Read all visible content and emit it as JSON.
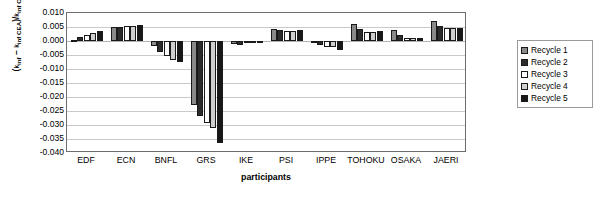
{
  "chart_data": {
    "type": "bar",
    "title": "",
    "xlabel": "participants",
    "ylabel": "(kinf - kinf CEA)/kinf CEA",
    "ylim": [
      -0.04,
      0.01
    ],
    "ytick_labels": [
      "0.010",
      "0.005",
      "0.000",
      "-0.005",
      "-0.010",
      "-0.015",
      "-0.020",
      "-0.025",
      "-0.030",
      "-0.035",
      "-0.040"
    ],
    "ytick_values": [
      0.01,
      0.005,
      0.0,
      -0.005,
      -0.01,
      -0.015,
      -0.02,
      -0.025,
      -0.03,
      -0.035,
      -0.04
    ],
    "grid": true,
    "legend_position": "right",
    "categories": [
      "EDF",
      "ECN",
      "BNFL",
      "GRS",
      "IKE",
      "PSI",
      "IPPE",
      "TOHOKU",
      "OSAKA",
      "JAERI"
    ],
    "series": [
      {
        "name": "Recycle 1",
        "color": "#8a8a8a",
        "values": [
          0.0003,
          0.005,
          -0.0018,
          -0.0228,
          -0.0012,
          0.0043,
          -0.0008,
          0.0062,
          0.004,
          0.0072
        ]
      },
      {
        "name": "Recycle 2",
        "color": "#2b2b2b",
        "values": [
          0.0013,
          0.005,
          -0.004,
          -0.0268,
          -0.0015,
          0.0038,
          -0.0015,
          0.0043,
          0.002,
          0.0053
        ]
      },
      {
        "name": "Recycle 3",
        "color": "#ffffff",
        "values": [
          0.0022,
          0.0052,
          -0.0052,
          -0.0293,
          -0.0008,
          0.0037,
          -0.0022,
          0.0031,
          0.001,
          0.0048
        ]
      },
      {
        "name": "Recycle 4",
        "color": "#cfcfcf",
        "values": [
          0.003,
          0.0053,
          -0.0068,
          -0.031,
          -0.0002,
          0.0037,
          -0.0022,
          0.0033,
          0.001,
          0.0047
        ]
      },
      {
        "name": "Recycle 5",
        "color": "#171717",
        "values": [
          0.0035,
          0.0057,
          -0.0075,
          -0.0363,
          0.0,
          0.0038,
          -0.0032,
          0.0035,
          0.0012,
          0.0048
        ]
      }
    ]
  },
  "legend": {
    "items": [
      {
        "label": "Recycle 1"
      },
      {
        "label": "Recycle 2"
      },
      {
        "label": "Recycle 3"
      },
      {
        "label": "Recycle 4"
      },
      {
        "label": "Recycle 5"
      }
    ]
  },
  "axis": {
    "x_title": "participants"
  }
}
